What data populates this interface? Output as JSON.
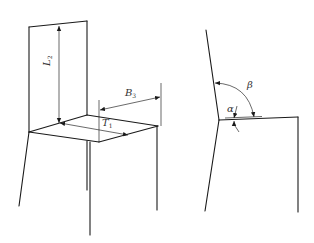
{
  "figure": {
    "left_view": {
      "name": "chair-perspective",
      "labels": {
        "backrest_height": {
          "symbol": "L",
          "subscript": "2"
        },
        "seat_width": {
          "symbol": "B",
          "subscript": "3"
        },
        "seat_depth": {
          "symbol": "T",
          "subscript": "1"
        }
      }
    },
    "right_view": {
      "name": "chair-side-profile",
      "labels": {
        "backrest_angle": {
          "symbol": "β"
        },
        "seat_angle": {
          "symbol": "α"
        }
      }
    },
    "colors": {
      "line": "#1a1a1a",
      "background": "#ffffff"
    }
  }
}
